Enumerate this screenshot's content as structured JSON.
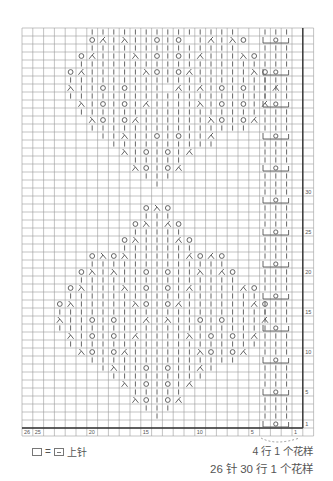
{
  "grid": {
    "left": 22,
    "top": 28,
    "cell_w": 10.8,
    "cell_h": 8,
    "columns": 26,
    "rows": 50,
    "line_color": "#9a9a9a",
    "thick_color": "#333333",
    "symbol_color": "#555555"
  },
  "column_labels": [
    {
      "col": 26,
      "label": "26"
    },
    {
      "col": 25,
      "label": "25"
    },
    {
      "col": 20,
      "label": "20"
    },
    {
      "col": 15,
      "label": "15"
    },
    {
      "col": 10,
      "label": "10"
    },
    {
      "col": 5,
      "label": "5"
    },
    {
      "col": 1,
      "label": "1"
    }
  ],
  "row_labels": [
    {
      "row": 1,
      "label": "1"
    },
    {
      "row": 5,
      "label": "5"
    },
    {
      "row": 10,
      "label": "10"
    },
    {
      "row": 15,
      "label": "15"
    },
    {
      "row": 20,
      "label": "20"
    },
    {
      "row": 25,
      "label": "25"
    },
    {
      "row": 30,
      "label": "30"
    }
  ],
  "symbol_key": {
    "k": "knit (|)",
    "o": "yarn over (○)",
    "L": "left-leaning decrease (⅄ / 入)",
    "R": "right-leaning decrease (人)",
    ".": "empty"
  },
  "rows_top_to_bottom": [
    "......kkkkkkkkkkkkkk......",
    "......oRkLkkoko kRkLo.....",
    "......kkkkkkkkkkkkkk......",
    ".....oRkkkLkokokRkkkLo....",
    ".....kkkkkkkkkkkkkkkkk....",
    "....oRkkkkkLokoRkkkkkLo...",
    "....kkkkkkkkkkkkkkkkkkk...",
    "....Lkkokokkk RkRkokokkR..",
    "....kkkkkkkkkkkkkkkkkkk...",
    ".....LkokokRkkkkLkokokR...",
    ".....kkkkkkkkkkkkkkkkk....",
    "......LokoRkkkkkkLokoR....",
    "......kkkkkkkkkkkkkkk.....",
    ".......kkLkkokokkR........",
    "........kkkkkkkkkk........",
    ".........LkokokR..........",
    "..........kkkkk...........",
    "..........LokoR...........",
    "...........kkk............",
    "............k.............",
    "..........................",
    "..........................",
    "...........oLo............",
    "...........kkk............",
    "..........oLkRo...........",
    "..........kkkkk...........",
    ".........oLkkkRo..........",
    ".........kkkkkkk..........",
    "......oLoLkkkkkRoRo.......",
    "......kkkkkkkkkkkkk.......",
    ".....oLkLkkokokkLkRo......",
    ".....kkkkkkkkkkkkkkk......",
    "....oLkkkLkokokRkkkkRo....",
    "....kkkkkkkkkkkkkkkkkk....",
    "...oLkkkkkLokoRkkkkkkRo...",
    "...kkkkkkkkkkkkkkkkkkkk...",
    "...LkkokokkRkLkkokokkkR...",
    "...kkkkkkkkkkkkkkkkkkkk...",
    "....LkokokRkkkkLkokokR....",
    "....kkkkkkkkkkkkkkkkkk....",
    ".....LokoRkkkkkkLokoR.....",
    "......kkkkkkkkkkkkkk......",
    ".......kLkkokokkRk........",
    "........kkkkkkkkk.........",
    ".........LkokokR..........",
    "..........kkkkk...........",
    "..........LokoR...........",
    "...........kkk............",
    "............k.............",
    ".........................."
  ],
  "cable_panel": {
    "columns": [
      4,
      3,
      2
    ],
    "cable_rows": [
      1,
      5,
      9,
      13,
      17,
      21,
      25,
      29,
      33,
      37,
      41,
      45,
      49
    ],
    "cable_symbol": "o",
    "description": "3-stitch cable: knit columns with yarn-over bracket every 4 rows"
  },
  "legend": {
    "empty_box_label": "□",
    "equals": "=",
    "meaning": "上针"
  },
  "notes": {
    "repeat_small": "4 行 1 个花样",
    "repeat_main": "26 针 30 行 1 个花样"
  }
}
